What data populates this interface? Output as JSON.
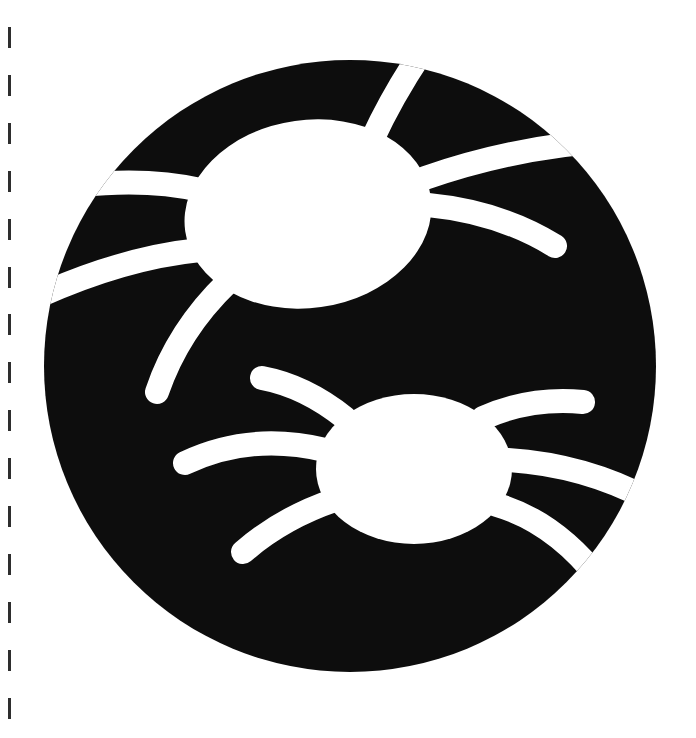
{
  "artwork": {
    "subject": "two spiders cut out of a black circle",
    "colors": {
      "background": "#ffffff",
      "circle": "#0d0d0d",
      "cutout": "#ffffff",
      "dash": "#2e2e2e"
    },
    "circle": {
      "cx": 350,
      "cy": 366,
      "r": 306
    },
    "spiders": [
      {
        "name": "upper-spider",
        "body": {
          "cx": 308,
          "cy": 214,
          "rx": 124,
          "ry": 94,
          "rotate": -8
        },
        "legs": [
          "M200,190 Q150,178 80,185",
          "M200,250 Q120,258 30,300",
          "M228,282 Q178,330 157,392",
          "M372,140 Q395,90 430,40",
          "M425,178 Q520,145 620,140",
          "M428,205 Q500,212 555,246"
        ]
      },
      {
        "name": "lower-spider",
        "body": {
          "cx": 414,
          "cy": 469,
          "rx": 98,
          "ry": 75,
          "rotate": 0
        },
        "legs": [
          "M345,418 Q305,386 262,378",
          "M325,450 Q250,432 185,463",
          "M335,500 Q282,518 243,552",
          "M483,418 Q530,397 583,402",
          "M508,460 Q585,465 650,500",
          "M497,505 Q555,522 600,580"
        ]
      }
    ],
    "leg_width": 24
  },
  "cut_line": {
    "dash_tops": [
      27,
      75,
      123,
      171,
      219,
      267,
      314,
      362,
      410,
      458,
      506,
      554,
      602,
      650,
      698
    ]
  }
}
